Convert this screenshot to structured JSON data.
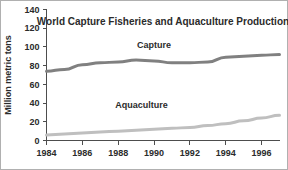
{
  "chart_data": {
    "type": "line",
    "title": "World Capture Fisheries and Aquaculture Production",
    "xlabel": "",
    "ylabel": "Million metric tons",
    "xlim": [
      1984,
      1997
    ],
    "ylim": [
      0,
      140
    ],
    "grid": false,
    "legend_position": "inline-labels",
    "x": [
      1984,
      1985,
      1986,
      1987,
      1988,
      1989,
      1990,
      1991,
      1992,
      1993,
      1994,
      1995,
      1996,
      1997
    ],
    "xticks": [
      1984,
      1986,
      1988,
      1990,
      1992,
      1994,
      1996
    ],
    "xtick_labels": [
      "1984",
      "1986",
      "1988",
      "1990",
      "1992",
      "1994",
      "1996"
    ],
    "yticks": [
      0,
      20,
      40,
      60,
      80,
      100,
      120,
      140
    ],
    "ytick_labels": [
      "0",
      "20",
      "40",
      "60",
      "80",
      "100",
      "120",
      "140"
    ],
    "series": [
      {
        "name": "Capture",
        "label": "Capture",
        "color": "#808080",
        "values": [
          74,
          76,
          81,
          83,
          84,
          86,
          85,
          83,
          83,
          84,
          89,
          90,
          91,
          92
        ]
      },
      {
        "name": "Aquaculture",
        "label": "Aquaculture",
        "color": "#bfbfbf",
        "values": [
          6,
          7,
          8,
          9,
          10,
          11,
          12,
          13,
          14,
          16,
          18,
          21,
          24,
          27
        ]
      }
    ],
    "annotations": [
      {
        "text": "Capture",
        "x": 1990.0,
        "y": 99
      },
      {
        "text": "Aquaculture",
        "x": 1989.3,
        "y": 35
      }
    ]
  }
}
